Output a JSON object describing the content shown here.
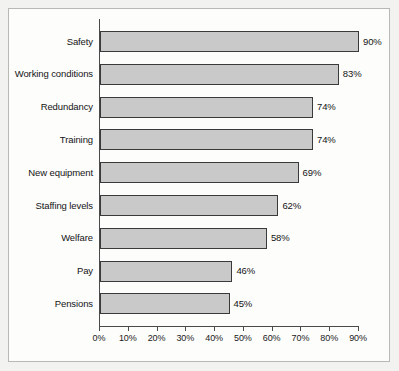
{
  "chart_data": {
    "type": "bar",
    "orientation": "horizontal",
    "title": "",
    "xlabel": "",
    "ylabel": "",
    "xlim": [
      0,
      90
    ],
    "grid": false,
    "legend": null,
    "categories": [
      "Safety",
      "Working conditions",
      "Redundancy",
      "Training",
      "New equipment",
      "Staffing levels",
      "Welfare",
      "Pay",
      "Pensions"
    ],
    "values": [
      90,
      83,
      74,
      74,
      69,
      62,
      58,
      46,
      45
    ],
    "value_labels": [
      "90%",
      "83%",
      "74%",
      "74%",
      "69%",
      "62%",
      "58%",
      "46%",
      "45%"
    ],
    "x_ticks": [
      0,
      10,
      20,
      30,
      40,
      50,
      60,
      70,
      80,
      90
    ],
    "x_tick_labels": [
      "0%",
      "10%",
      "20%",
      "30%",
      "40%",
      "50%",
      "60%",
      "70%",
      "80%",
      "90%"
    ],
    "colors": {
      "bar_fill": "#c9c9c9",
      "bar_stroke": "#3a3a3a",
      "axis": "#4a4a4a",
      "text": "#141414",
      "plot_background": "#fdfdfc",
      "page_background": "#f2f2f0",
      "frame_border": "#b8b8b4"
    }
  }
}
